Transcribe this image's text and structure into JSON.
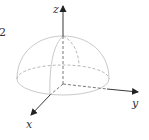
{
  "figure": {
    "type": "hemisphere-3d-axes",
    "side_label": "2",
    "axes": {
      "x": {
        "label": "x"
      },
      "y": {
        "label": "y"
      },
      "z": {
        "label": "z"
      }
    },
    "colors": {
      "axis": "#333333",
      "surface": "#bbbbbb",
      "hidden": "#999999",
      "text": "#333333"
    }
  }
}
